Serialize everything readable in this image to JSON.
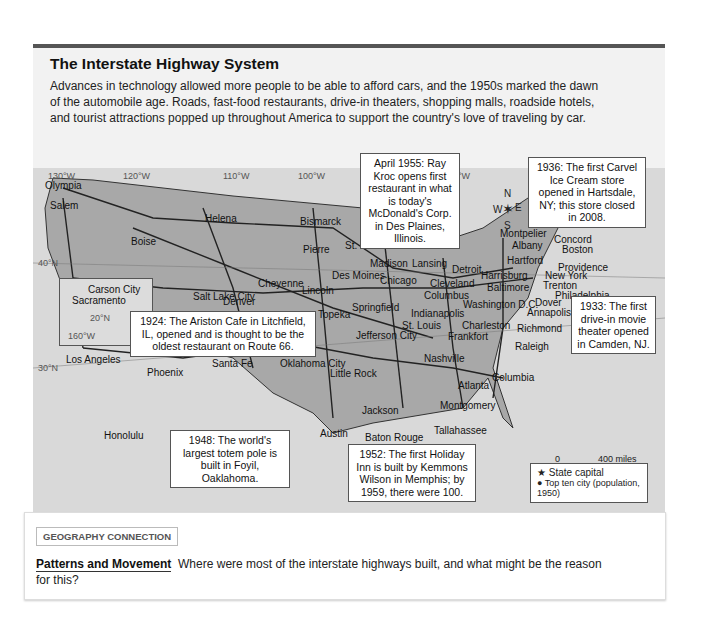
{
  "header": {
    "title": "The Interstate Highway System",
    "description": "Advances in technology allowed more people to be able to afford cars, and the 1950s marked the dawn of the automobile age. Roads, fast-food restaurants, drive-in theaters, shopping malls, roadside hotels, and tourist attractions popped up throughout America to support the country's love of traveling by car."
  },
  "map": {
    "longitudes": [
      "130°W",
      "120°W",
      "110°W",
      "100°W",
      "90°W",
      "80°W",
      "70°W",
      "60°W"
    ],
    "latitudes": [
      "40°N",
      "30°N"
    ],
    "compass": {
      "n": "N",
      "s": "S",
      "e": "E",
      "w": "W"
    },
    "cities": [
      {
        "name": "Olympia",
        "x": 45,
        "y": 180
      },
      {
        "name": "Salem",
        "x": 50,
        "y": 200
      },
      {
        "name": "Helena",
        "x": 205,
        "y": 213
      },
      {
        "name": "Boise",
        "x": 131,
        "y": 236
      },
      {
        "name": "Bismarck",
        "x": 300,
        "y": 216
      },
      {
        "name": "Pierre",
        "x": 303,
        "y": 244
      },
      {
        "name": "St. Paul",
        "x": 345,
        "y": 240
      },
      {
        "name": "Madison",
        "x": 370,
        "y": 258
      },
      {
        "name": "Lansing",
        "x": 412,
        "y": 258
      },
      {
        "name": "Detroit",
        "x": 452,
        "y": 264
      },
      {
        "name": "Chicago",
        "x": 380,
        "y": 275
      },
      {
        "name": "Des Moines",
        "x": 332,
        "y": 270
      },
      {
        "name": "Cheyenne",
        "x": 258,
        "y": 278
      },
      {
        "name": "Lincoln",
        "x": 302,
        "y": 285
      },
      {
        "name": "Carson City",
        "x": 88,
        "y": 284
      },
      {
        "name": "Sacramento",
        "x": 72,
        "y": 295
      },
      {
        "name": "Salt Lake City",
        "x": 193,
        "y": 291
      },
      {
        "name": "Denver",
        "x": 223,
        "y": 296
      },
      {
        "name": "Topeka",
        "x": 318,
        "y": 309
      },
      {
        "name": "Springfield",
        "x": 352,
        "y": 302
      },
      {
        "name": "Cleveland",
        "x": 430,
        "y": 278
      },
      {
        "name": "Columbus",
        "x": 424,
        "y": 290
      },
      {
        "name": "Indianapolis",
        "x": 411,
        "y": 308
      },
      {
        "name": "St. Louis",
        "x": 402,
        "y": 320
      },
      {
        "name": "Jefferson City",
        "x": 356,
        "y": 330
      },
      {
        "name": "Frankfort",
        "x": 448,
        "y": 331
      },
      {
        "name": "Harrisburg",
        "x": 481,
        "y": 270
      },
      {
        "name": "Baltimore",
        "x": 487,
        "y": 282
      },
      {
        "name": "Washington D.C.",
        "x": 463,
        "y": 299
      },
      {
        "name": "Charleston",
        "x": 462,
        "y": 320
      },
      {
        "name": "Richmond",
        "x": 517,
        "y": 323
      },
      {
        "name": "Raleigh",
        "x": 515,
        "y": 341
      },
      {
        "name": "Dover",
        "x": 535,
        "y": 297
      },
      {
        "name": "Annapolis",
        "x": 527,
        "y": 307
      },
      {
        "name": "Montpelier",
        "x": 500,
        "y": 228
      },
      {
        "name": "Albany",
        "x": 512,
        "y": 240
      },
      {
        "name": "Hartford",
        "x": 507,
        "y": 255
      },
      {
        "name": "Augusta",
        "x": 565,
        "y": 215
      },
      {
        "name": "Concord",
        "x": 554,
        "y": 234
      },
      {
        "name": "Boston",
        "x": 562,
        "y": 244
      },
      {
        "name": "Providence",
        "x": 558,
        "y": 262
      },
      {
        "name": "New York",
        "x": 545,
        "y": 270
      },
      {
        "name": "Trenton",
        "x": 543,
        "y": 280
      },
      {
        "name": "Philadelphia",
        "x": 555,
        "y": 290
      },
      {
        "name": "Los Angeles",
        "x": 66,
        "y": 354
      },
      {
        "name": "Phoenix",
        "x": 147,
        "y": 367
      },
      {
        "name": "Santa Fe",
        "x": 212,
        "y": 358
      },
      {
        "name": "Oklahoma City",
        "x": 280,
        "y": 358
      },
      {
        "name": "Little Rock",
        "x": 330,
        "y": 368
      },
      {
        "name": "Nashville",
        "x": 424,
        "y": 353
      },
      {
        "name": "Atlanta",
        "x": 458,
        "y": 380
      },
      {
        "name": "Columbia",
        "x": 492,
        "y": 372
      },
      {
        "name": "Jackson",
        "x": 362,
        "y": 405
      },
      {
        "name": "Montgomery",
        "x": 440,
        "y": 400
      },
      {
        "name": "Austin",
        "x": 320,
        "y": 428
      },
      {
        "name": "Baton Rouge",
        "x": 365,
        "y": 432
      },
      {
        "name": "Tallahassee",
        "x": 434,
        "y": 425
      },
      {
        "name": "Honolulu",
        "x": 104,
        "y": 430
      }
    ],
    "inset": {
      "latitude": "20°N",
      "longitude": "160°W"
    }
  },
  "callouts": {
    "mcdonalds": "April 1955: Ray Kroc opens first restaurant in what is today's McDonald's Corp. in Des Plaines, Illinois.",
    "carvel": "1936: The first Carvel Ice Cream store opened in Hartsdale, NY; this store closed in 2008.",
    "ariston": "1924: The Ariston Cafe in Litchfield, IL, opened and is thought to be the oldest restaurant on Route 66.",
    "drivein": "1933: The first drive-in movie theater opened in Camden, NJ.",
    "totem": "1948: The world's largest totem pole is built in Foyil, Oaklahoma.",
    "holiday": "1952: The first Holiday Inn is built by Kemmons Wilson in Memphis; by 1959, there were 100."
  },
  "scale": {
    "miles_zero": "0",
    "miles": "400 miles",
    "km_zero": "0",
    "km": "400 kilometers",
    "projection": "Albers Equal-Area projection"
  },
  "legend": {
    "state_capital": "State capital",
    "top_city": "Top ten city (population, 1950)",
    "highway": "Interstate highway"
  },
  "footer": {
    "badge": "GEOGRAPHY CONNECTION",
    "question_title": "Patterns and Movement",
    "question_text": "Where were most of the interstate highways built, and what might be the reason for this?"
  }
}
